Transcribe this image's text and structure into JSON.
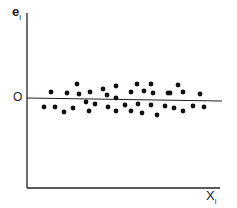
{
  "chart_data": {
    "type": "scatter",
    "title": "",
    "xlabel": "X",
    "xlabel_sub": "i",
    "ylabel": "e",
    "ylabel_sub": "i",
    "y_reference_label": "O",
    "grid": false,
    "legend": null,
    "colors": {
      "axis": "#222222",
      "points": "#111111",
      "zero_line": "#222222"
    },
    "zero_line": {
      "x1": 27,
      "y1": 98,
      "x2": 222,
      "y2": 101
    },
    "axes": {
      "origin": [
        27,
        188
      ],
      "y_top": 13,
      "x_right": 220
    },
    "points_px": [
      [
        44,
        107
      ],
      [
        51,
        92
      ],
      [
        55,
        107
      ],
      [
        64,
        112
      ],
      [
        67,
        93
      ],
      [
        73,
        108
      ],
      [
        77,
        84
      ],
      [
        79,
        94
      ],
      [
        86,
        102
      ],
      [
        89,
        111
      ],
      [
        90,
        92
      ],
      [
        95,
        104
      ],
      [
        103,
        89
      ],
      [
        107,
        95
      ],
      [
        108,
        107
      ],
      [
        116,
        86
      ],
      [
        116,
        98
      ],
      [
        116,
        111
      ],
      [
        125,
        105
      ],
      [
        131,
        92
      ],
      [
        131,
        111
      ],
      [
        137,
        84
      ],
      [
        138,
        104
      ],
      [
        142,
        113
      ],
      [
        144,
        91
      ],
      [
        151,
        84
      ],
      [
        151,
        105
      ],
      [
        153,
        93
      ],
      [
        157,
        115
      ],
      [
        165,
        106
      ],
      [
        168,
        93
      ],
      [
        170,
        93
      ],
      [
        174,
        108
      ],
      [
        178,
        85
      ],
      [
        183,
        92
      ],
      [
        183,
        111
      ],
      [
        193,
        106
      ],
      [
        200,
        94
      ],
      [
        204,
        107
      ]
    ]
  }
}
